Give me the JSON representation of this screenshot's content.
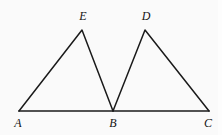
{
  "figure": {
    "background_color": "#fafafa",
    "stroke_color": "#1a1a1a",
    "width": 222,
    "height": 135
  },
  "points": {
    "A": {
      "label": "A",
      "x": 19,
      "y": 111,
      "label_x": 18,
      "label_y": 127
    },
    "B": {
      "label": "B",
      "x": 113,
      "y": 111,
      "label_x": 113,
      "label_y": 127
    },
    "C": {
      "label": "C",
      "x": 209,
      "y": 111,
      "label_x": 208,
      "label_y": 127
    },
    "D": {
      "label": "D",
      "x": 145,
      "y": 30,
      "label_x": 146,
      "label_y": 20
    },
    "E": {
      "label": "E",
      "x": 82,
      "y": 30,
      "label_x": 83,
      "label_y": 20
    }
  },
  "segments": {
    "base_AC": "19,111 209,111",
    "left_triangle_AEB": "19,111 82,30 113,111",
    "right_triangle_BDC": "113,111 145,30 209,111"
  },
  "labels": {
    "A": "A",
    "B": "B",
    "C": "C",
    "D": "D",
    "E": "E"
  }
}
